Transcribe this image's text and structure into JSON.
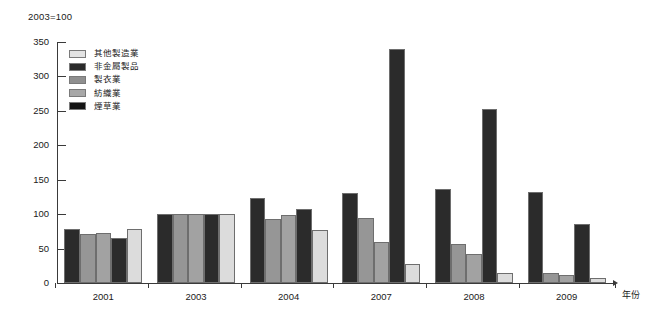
{
  "chart_data": {
    "type": "bar",
    "title": "2003=100",
    "xlabel": "年份",
    "ylabel": "",
    "categories": [
      "2001",
      "2003",
      "2004",
      "2007",
      "2008",
      "2009"
    ],
    "ylim": [
      0,
      350
    ],
    "yticks": [
      0,
      50,
      100,
      150,
      200,
      250,
      300,
      350
    ],
    "grid": false,
    "legend_position": "top-left",
    "series": [
      {
        "name": "其他製造業",
        "color": "#2b2b2b",
        "values": [
          78,
          100,
          123,
          131,
          136,
          132
        ]
      },
      {
        "name": "非金屬製品",
        "color": "#969696",
        "values": [
          71,
          100,
          93,
          95,
          57,
          15
        ]
      },
      {
        "name": "製衣業",
        "color": "#a2a2a2",
        "values": [
          73,
          100,
          99,
          60,
          42,
          11
        ]
      },
      {
        "name": "紡織業",
        "color": "#2b2b2b",
        "values": [
          65,
          100,
          108,
          340,
          252,
          85
        ]
      },
      {
        "name": "煙草業",
        "color": "#dcdcdc",
        "values": [
          79,
          100,
          77,
          27,
          15,
          8
        ]
      }
    ],
    "legend_entries": [
      {
        "label": "其他製造業",
        "swatch": "#e3e3e3"
      },
      {
        "label": "非金屬製品",
        "swatch": "#2b2b2b"
      },
      {
        "label": "製衣業",
        "swatch": "#8f8f8f"
      },
      {
        "label": "紡織業",
        "swatch": "#a8a8a8"
      },
      {
        "label": "煙草業",
        "swatch": "#141414"
      }
    ]
  }
}
